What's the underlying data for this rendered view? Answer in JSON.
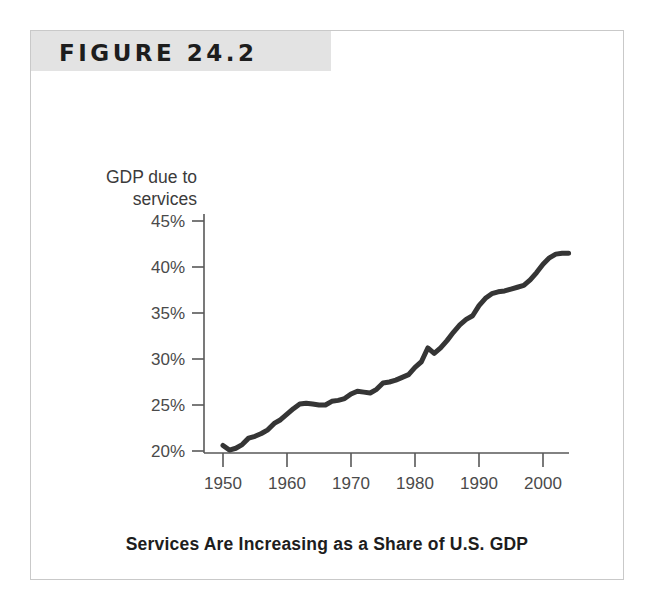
{
  "figure": {
    "banner_label": "FIGURE 24.2",
    "caption": "Services Are Increasing as a Share of U.S. GDP"
  },
  "colors": {
    "banner_background": "#e3e3e3",
    "card_border": "#c9c9c9",
    "line": "#353535",
    "axis": "#585858",
    "tick_text": "#4a4a4a",
    "caption_text": "#1d1d1d"
  },
  "chart_data": {
    "type": "line",
    "title": "FIGURE 24.2",
    "subtitle": "Services Are Increasing as a Share of U.S. GDP",
    "xlabel": "Year",
    "ylabel": "GDP due to services",
    "ylabel_line1": "GDP due to",
    "ylabel_line2": "services",
    "grid": false,
    "legend": false,
    "xlim": [
      1948,
      2006
    ],
    "ylim": [
      18.5,
      46.5
    ],
    "xticks": [
      1950,
      1960,
      1970,
      1980,
      1990,
      2000
    ],
    "xtick_labels": [
      "1950",
      "1960",
      "1970",
      "1980",
      "1990",
      "2000"
    ],
    "yticks": [
      20,
      25,
      30,
      35,
      40,
      45
    ],
    "ytick_labels": [
      "20%",
      "25%",
      "30%",
      "35%",
      "40%",
      "45%"
    ],
    "series": [
      {
        "name": "GDP due to services",
        "x": [
          1950,
          1951,
          1952,
          1953,
          1954,
          1955,
          1956,
          1957,
          1958,
          1959,
          1960,
          1961,
          1962,
          1963,
          1964,
          1965,
          1966,
          1967,
          1968,
          1969,
          1970,
          1971,
          1972,
          1973,
          1974,
          1975,
          1976,
          1977,
          1978,
          1979,
          1980,
          1981,
          1982,
          1983,
          1984,
          1985,
          1986,
          1987,
          1988,
          1989,
          1990,
          1991,
          1992,
          1993,
          1994,
          1995,
          1996,
          1997,
          1998,
          1999,
          2000,
          2001,
          2002,
          2003,
          2004
        ],
        "values": [
          20.6,
          20.1,
          20.3,
          20.7,
          21.4,
          21.6,
          21.9,
          22.3,
          23.0,
          23.4,
          24.0,
          24.6,
          25.1,
          25.2,
          25.1,
          25.0,
          25.0,
          25.4,
          25.5,
          25.7,
          26.2,
          26.5,
          26.4,
          26.3,
          26.7,
          27.4,
          27.5,
          27.7,
          28.0,
          28.3,
          29.1,
          29.7,
          31.2,
          30.6,
          31.2,
          32.0,
          32.9,
          33.7,
          34.3,
          34.7,
          35.8,
          36.6,
          37.1,
          37.3,
          37.4,
          37.6,
          37.8,
          38.0,
          38.6,
          39.4,
          40.3,
          41.0,
          41.4,
          41.5,
          41.5
        ]
      }
    ]
  }
}
